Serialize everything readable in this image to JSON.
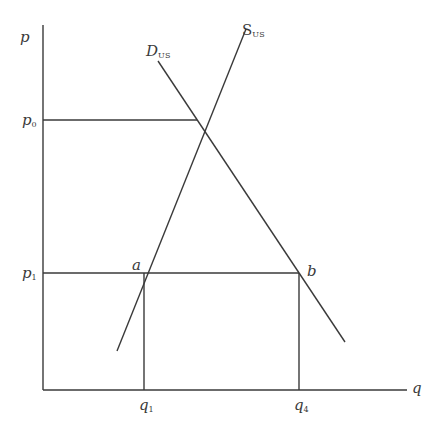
{
  "diagram": {
    "type": "supply-demand",
    "axes": {
      "y_label": "p",
      "x_label": "q"
    },
    "price_levels": [
      {
        "id": "p0",
        "label": "p",
        "subscript": "0"
      },
      {
        "id": "p1",
        "label": "p",
        "subscript": "1"
      }
    ],
    "quantity_levels": [
      {
        "id": "q1",
        "label": "q",
        "subscript": "1"
      },
      {
        "id": "q4",
        "label": "q",
        "subscript": "4"
      }
    ],
    "curves": [
      {
        "id": "supply",
        "label": "S",
        "subscript": "US",
        "slope": "upward"
      },
      {
        "id": "demand",
        "label": "D",
        "subscript": "US",
        "slope": "downward"
      }
    ],
    "points": [
      {
        "id": "a",
        "label": "a",
        "location": "supply at p1 (q1, p1)"
      },
      {
        "id": "b",
        "label": "b",
        "location": "demand at p1 (q4, p1)"
      }
    ],
    "equilibrium": {
      "price": "p0",
      "description": "intersection of S_US and D_US"
    }
  }
}
